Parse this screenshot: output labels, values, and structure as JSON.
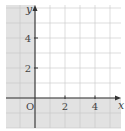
{
  "chart_data": {
    "type": "region",
    "title": "",
    "xlabel": "x",
    "ylabel": "y",
    "origin_label": "O",
    "xlim": [
      -2,
      6
    ],
    "ylim": [
      -2,
      6
    ],
    "x_ticks": [
      2,
      4
    ],
    "x_tick_labels": [
      "2",
      "4"
    ],
    "y_ticks": [
      2,
      4
    ],
    "y_tick_labels": [
      "2",
      "4"
    ],
    "grid": true,
    "grid_step": 1,
    "shaded_region": "x <= 0 or y <= 0",
    "unshaded_region": "x > 0 and y > 0",
    "colors": {
      "shade": "#e2e2e2",
      "background": "#ffffff",
      "grid": "#c8c8c8",
      "axis": "#333333"
    }
  }
}
